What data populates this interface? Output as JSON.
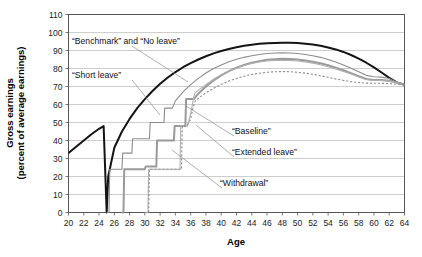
{
  "chart_data": {
    "type": "line",
    "title": "",
    "xlabel": "Age",
    "ylabel": "Gross earnings (percent of average earnings)",
    "ylabel_line1": "Gross earnings",
    "ylabel_line2": "(percent of average earnings)",
    "xlim": [
      20,
      64
    ],
    "ylim": [
      0,
      110
    ],
    "xticks": [
      20,
      22,
      24,
      26,
      28,
      30,
      32,
      34,
      36,
      38,
      40,
      42,
      44,
      46,
      48,
      50,
      52,
      54,
      56,
      58,
      60,
      62,
      64
    ],
    "yticks": [
      0,
      10,
      20,
      30,
      40,
      50,
      60,
      70,
      80,
      90,
      100,
      110
    ],
    "grid": true,
    "legend_position": "inline-annotations",
    "annotations": [
      {
        "text": "“Benchmark” and “No leave”",
        "x_px": 72,
        "y_px": 44,
        "leader_to_x_px": 188,
        "leader_to_y_px": 82
      },
      {
        "text": "“Short leave”",
        "x_px": 72,
        "y_px": 78,
        "leader_to_x_px": 160,
        "leader_to_y_px": 115
      },
      {
        "text": "“Baseline”",
        "x_px": 232,
        "y_px": 134,
        "leader_to_x_px": 186,
        "leader_to_y_px": 106
      },
      {
        "text": "“Extended leave”",
        "x_px": 232,
        "y_px": 155,
        "leader_to_x_px": 196,
        "leader_to_y_px": 125
      },
      {
        "text": "“Withdrawal”",
        "x_px": 220,
        "y_px": 186,
        "leader_to_x_px": 172,
        "leader_to_y_px": 150
      }
    ],
    "series": [
      {
        "name": "Benchmark and No leave",
        "style": "solid",
        "color": "#141414",
        "width": 2.0,
        "points": [
          [
            20,
            33
          ],
          [
            21,
            36.5
          ],
          [
            22,
            40
          ],
          [
            23,
            43.5
          ],
          [
            24,
            46.5
          ],
          [
            24.6,
            48
          ],
          [
            25,
            0
          ],
          [
            25.2,
            20
          ],
          [
            26,
            36
          ],
          [
            27,
            45
          ],
          [
            28,
            52
          ],
          [
            29,
            58
          ],
          [
            30,
            63
          ],
          [
            31,
            67.5
          ],
          [
            32,
            71.5
          ],
          [
            33,
            75
          ],
          [
            34,
            78
          ],
          [
            35,
            80.7
          ],
          [
            36,
            83
          ],
          [
            37,
            85
          ],
          [
            38,
            86.8
          ],
          [
            39,
            88.4
          ],
          [
            40,
            89.7
          ],
          [
            41,
            90.8
          ],
          [
            42,
            91.8
          ],
          [
            43,
            92.6
          ],
          [
            44,
            93.2
          ],
          [
            45,
            93.7
          ],
          [
            46,
            94
          ],
          [
            47,
            94.2
          ],
          [
            48,
            94.3
          ],
          [
            49,
            94.3
          ],
          [
            50,
            94.1
          ],
          [
            51,
            93.8
          ],
          [
            52,
            93.3
          ],
          [
            53,
            92.6
          ],
          [
            54,
            91.7
          ],
          [
            55,
            90.6
          ],
          [
            56,
            89.2
          ],
          [
            57,
            87.5
          ],
          [
            58,
            85.5
          ],
          [
            59,
            83.2
          ],
          [
            60,
            80.6
          ],
          [
            61,
            77.8
          ],
          [
            62,
            74.8
          ],
          [
            63,
            72.3
          ],
          [
            64,
            71
          ]
        ]
      },
      {
        "name": "Short leave",
        "style": "solid",
        "color": "#8c8c8c",
        "width": 1.1,
        "points": [
          [
            25,
            0
          ],
          [
            25.3,
            0
          ],
          [
            25.4,
            24
          ],
          [
            27,
            24
          ],
          [
            27.1,
            33
          ],
          [
            28.3,
            33
          ],
          [
            28.4,
            41
          ],
          [
            30.6,
            41
          ],
          [
            30.7,
            50
          ],
          [
            32.5,
            50
          ],
          [
            32.6,
            58
          ],
          [
            33.6,
            58
          ],
          [
            34,
            62
          ],
          [
            35,
            67
          ],
          [
            36,
            71
          ],
          [
            37,
            74.5
          ],
          [
            38,
            77.5
          ],
          [
            39,
            80
          ],
          [
            40,
            82
          ],
          [
            41,
            83.7
          ],
          [
            42,
            85.1
          ],
          [
            43,
            86.2
          ],
          [
            44,
            87.1
          ],
          [
            45,
            87.8
          ],
          [
            46,
            88.3
          ],
          [
            47,
            88.6
          ],
          [
            48,
            88.7
          ],
          [
            49,
            88.6
          ],
          [
            50,
            88.3
          ],
          [
            51,
            87.8
          ],
          [
            52,
            87.1
          ],
          [
            53,
            86.2
          ],
          [
            54,
            85
          ],
          [
            55,
            83.6
          ],
          [
            56,
            82
          ],
          [
            57,
            80.2
          ],
          [
            58,
            78.2
          ],
          [
            59,
            76.2
          ],
          [
            60,
            75.4
          ],
          [
            61,
            75.2
          ],
          [
            62,
            74.4
          ],
          [
            63,
            72.3
          ],
          [
            64,
            71
          ]
        ]
      },
      {
        "name": "Baseline",
        "style": "solid",
        "color": "#9a9a9a",
        "width": 2.0,
        "points": [
          [
            27,
            0
          ],
          [
            27.2,
            0
          ],
          [
            27.3,
            24
          ],
          [
            30,
            24
          ],
          [
            30.1,
            25.5
          ],
          [
            31.5,
            25.5
          ],
          [
            31.6,
            40
          ],
          [
            33.8,
            40
          ],
          [
            33.9,
            48
          ],
          [
            35.3,
            48
          ],
          [
            35.4,
            63
          ],
          [
            36.4,
            63
          ],
          [
            37,
            66
          ],
          [
            38,
            70
          ],
          [
            39,
            73.4
          ],
          [
            40,
            76.2
          ],
          [
            41,
            78.5
          ],
          [
            42,
            80.4
          ],
          [
            43,
            82
          ],
          [
            44,
            83.2
          ],
          [
            45,
            84.1
          ],
          [
            46,
            84.8
          ],
          [
            47,
            85.2
          ],
          [
            48,
            85.4
          ],
          [
            49,
            85.3
          ],
          [
            50,
            85
          ],
          [
            51,
            84.5
          ],
          [
            52,
            83.8
          ],
          [
            53,
            82.9
          ],
          [
            54,
            81.8
          ],
          [
            55,
            80.5
          ],
          [
            56,
            79
          ],
          [
            57,
            77.4
          ],
          [
            58,
            75.7
          ],
          [
            59,
            74.2
          ],
          [
            60,
            73.6
          ],
          [
            61,
            73.6
          ],
          [
            62,
            73.2
          ],
          [
            63,
            72.2
          ],
          [
            64,
            71
          ]
        ]
      },
      {
        "name": "Extended leave",
        "style": "solid",
        "color": "#b0b0b0",
        "width": 1.1,
        "points": [
          [
            30,
            0
          ],
          [
            30.4,
            0
          ],
          [
            30.5,
            24
          ],
          [
            34.6,
            24
          ],
          [
            34.7,
            48
          ],
          [
            35.6,
            48
          ],
          [
            36,
            55
          ],
          [
            36.5,
            66
          ],
          [
            37,
            68
          ],
          [
            38,
            71
          ],
          [
            39,
            74
          ],
          [
            40,
            76.5
          ],
          [
            41,
            78.6
          ],
          [
            42,
            80.3
          ],
          [
            43,
            81.7
          ],
          [
            44,
            82.8
          ],
          [
            45,
            83.6
          ],
          [
            46,
            84.2
          ],
          [
            47,
            84.5
          ],
          [
            48,
            84.6
          ],
          [
            49,
            84.5
          ],
          [
            50,
            84.2
          ],
          [
            51,
            83.7
          ],
          [
            52,
            83
          ],
          [
            53,
            82.1
          ],
          [
            54,
            81
          ],
          [
            55,
            79.8
          ],
          [
            56,
            78.4
          ],
          [
            57,
            76.9
          ],
          [
            58,
            75.3
          ],
          [
            59,
            73.9
          ],
          [
            60,
            73.3
          ],
          [
            61,
            73.3
          ],
          [
            62,
            73
          ],
          [
            63,
            72.1
          ],
          [
            64,
            71
          ]
        ]
      },
      {
        "name": "Withdrawal",
        "style": "dashed",
        "color": "#8e8e8e",
        "width": 1.1,
        "points": [
          [
            30,
            0
          ],
          [
            30.5,
            0
          ],
          [
            30.6,
            24
          ],
          [
            34.8,
            24
          ],
          [
            34.9,
            48
          ],
          [
            35.5,
            48
          ],
          [
            36,
            52
          ],
          [
            36.3,
            58
          ],
          [
            36.6,
            62
          ],
          [
            37,
            63.5
          ],
          [
            38,
            66.5
          ],
          [
            39,
            69
          ],
          [
            40,
            71.2
          ],
          [
            41,
            73
          ],
          [
            42,
            74.5
          ],
          [
            43,
            75.7
          ],
          [
            44,
            76.7
          ],
          [
            45,
            77.4
          ],
          [
            46,
            77.9
          ],
          [
            47,
            78.2
          ],
          [
            48,
            78.3
          ],
          [
            49,
            78.2
          ],
          [
            50,
            77.9
          ],
          [
            51,
            77.4
          ],
          [
            52,
            76.8
          ],
          [
            53,
            76
          ],
          [
            54,
            75.1
          ],
          [
            55,
            74.2
          ],
          [
            56,
            73.4
          ],
          [
            57,
            72.7
          ],
          [
            58,
            72.2
          ],
          [
            59,
            71.9
          ],
          [
            60,
            71.8
          ],
          [
            61,
            71.8
          ],
          [
            62,
            71.6
          ],
          [
            63,
            71.3
          ],
          [
            64,
            71
          ]
        ]
      }
    ]
  },
  "axes": {
    "x_title": "Age",
    "y_title_line1": "Gross earnings",
    "y_title_line2": "(percent of average earnings)"
  },
  "labels": {
    "benchmark_no_leave": "“Benchmark” and “No leave”",
    "short_leave": "“Short leave”",
    "baseline": "“Baseline”",
    "extended_leave": "“Extended leave”",
    "withdrawal": "“Withdrawal”"
  },
  "colors": {
    "benchmark": "#141414",
    "short_leave": "#8c8c8c",
    "baseline": "#9a9a9a",
    "extended_leave": "#b0b0b0",
    "withdrawal": "#8e8e8e",
    "grid": "#b9b9b9",
    "frame": "#555555",
    "text": "#111111",
    "background": "#ffffff"
  }
}
